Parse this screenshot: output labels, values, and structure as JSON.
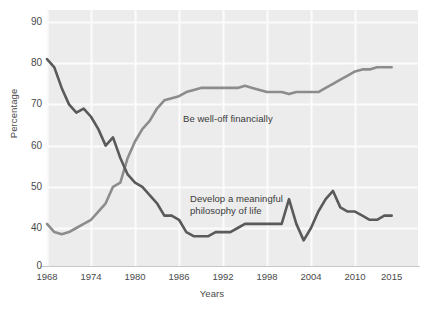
{
  "chart_data": {
    "type": "line",
    "title": "",
    "xlabel": "Years",
    "ylabel": "Percentage",
    "xlim": [
      1966,
      2016
    ],
    "ylim": [
      35,
      93
    ],
    "grid": true,
    "legend_position": "inline-annotation",
    "x_ticks": [
      1968,
      1974,
      1980,
      1986,
      1992,
      1998,
      2004,
      2010,
      2015
    ],
    "y_ticks": [
      0,
      40,
      50,
      60,
      70,
      80,
      90
    ],
    "axis_break": true,
    "series": [
      {
        "name": "Be well-off financially",
        "color": "#8c8c8c",
        "x": [
          1968,
          1969,
          1970,
          1971,
          1972,
          1973,
          1974,
          1975,
          1976,
          1977,
          1978,
          1979,
          1980,
          1981,
          1982,
          1983,
          1984,
          1985,
          1986,
          1987,
          1988,
          1989,
          1990,
          1991,
          1992,
          1993,
          1994,
          1995,
          1996,
          1997,
          1998,
          1999,
          2000,
          2001,
          2002,
          2003,
          2004,
          2005,
          2006,
          2007,
          2008,
          2009,
          2010,
          2011,
          2012,
          2013,
          2014,
          2015
        ],
        "values": [
          41,
          39,
          38.5,
          39,
          40,
          41,
          42,
          44,
          46,
          50,
          51,
          57,
          61,
          64,
          66,
          69,
          71,
          71.5,
          72,
          73,
          73.5,
          74,
          74,
          74,
          74,
          74,
          74,
          74.5,
          74,
          73.5,
          73,
          73,
          73,
          72.5,
          73,
          73,
          73,
          73,
          74,
          75,
          76,
          77,
          78,
          78.5,
          78.5,
          79,
          79,
          79
        ]
      },
      {
        "name": "Develop a meaningful philosophy of life",
        "color": "#5a5a5a",
        "x": [
          1968,
          1969,
          1970,
          1971,
          1972,
          1973,
          1974,
          1975,
          1976,
          1977,
          1978,
          1979,
          1980,
          1981,
          1982,
          1983,
          1984,
          1985,
          1986,
          1987,
          1988,
          1989,
          1990,
          1991,
          1992,
          1993,
          1994,
          1995,
          1996,
          1997,
          1998,
          1999,
          2000,
          2001,
          2002,
          2003,
          2004,
          2005,
          2006,
          2007,
          2008,
          2009,
          2010,
          2011,
          2012,
          2013,
          2014,
          2015
        ],
        "values": [
          81,
          79,
          74,
          70,
          68,
          69,
          67,
          64,
          60,
          62,
          57,
          53,
          51,
          50,
          48,
          46,
          43,
          43,
          42,
          39,
          38,
          38,
          38,
          39,
          39,
          39,
          40,
          41,
          41,
          41,
          41,
          41,
          41,
          47,
          41,
          37,
          40,
          44,
          47,
          49,
          45,
          44,
          44,
          43,
          42,
          42,
          43,
          43
        ]
      }
    ]
  },
  "axis": {
    "y_title": "Percentage",
    "x_title": "Years",
    "y_tick_labels": [
      "90",
      "80",
      "70",
      "60",
      "50",
      "40",
      "0"
    ],
    "x_tick_labels": [
      "1968",
      "1974",
      "1980",
      "1986",
      "1992",
      "1998",
      "2004",
      "2010",
      "2015"
    ]
  },
  "annotations": {
    "welloff": "Be well-off financially",
    "philosophy": "Develop a meaningful\nphilosophy of life"
  },
  "colors": {
    "plot_background": "#ececec",
    "gridline": "#fbfbfb",
    "line_welloff": "#8c8c8c",
    "line_philosophy": "#565656",
    "axis_line": "#c9c9c9",
    "text": "#4a4a4a"
  }
}
